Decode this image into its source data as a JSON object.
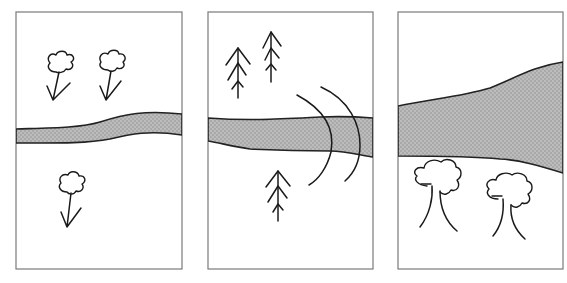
{
  "figure": {
    "colors": {
      "background": "#ffffff",
      "frame": "#7a7a7a",
      "river_fill": "#a9a9a9",
      "river_dots": "#c4c4c4",
      "ink": "#1a1a1a"
    },
    "panels": [
      {
        "id": "panel-1",
        "contents": [
          "thin winding river",
          "two flowers above river",
          "one flower below river"
        ]
      },
      {
        "id": "panel-2",
        "contents": [
          "river",
          "two fir trees above river",
          "one fir tree below river",
          "two curved arcs crossing river"
        ]
      },
      {
        "id": "panel-3",
        "contents": [
          "wide river widening to the right",
          "two bushy trees below river"
        ]
      }
    ]
  }
}
